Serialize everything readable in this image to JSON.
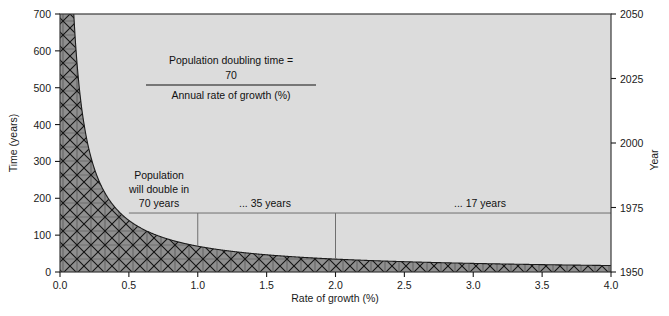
{
  "chart_data": {
    "type": "line",
    "title": "",
    "xlabel": "Rate of growth (%)",
    "ylabel": "Time (years)",
    "y2label": "Year",
    "xlim": [
      0.0,
      4.0
    ],
    "ylim": [
      0,
      700
    ],
    "y2lim": [
      1950,
      2050
    ],
    "grid": false,
    "legend": null,
    "function": "Time = 70 / Rate of growth",
    "xticks": [
      "0.0",
      "0.5",
      "1.0",
      "1.5",
      "2.0",
      "2.5",
      "3.0",
      "3.5",
      "4.0"
    ],
    "xtick_values": [
      0.0,
      0.5,
      1.0,
      1.5,
      2.0,
      2.5,
      3.0,
      3.5,
      4.0
    ],
    "yticks": [
      "0",
      "100",
      "200",
      "300",
      "400",
      "500",
      "600",
      "700"
    ],
    "ytick_values": [
      0,
      100,
      200,
      300,
      400,
      500,
      600,
      700
    ],
    "y2ticks": [
      "1950",
      "1975",
      "2000",
      "2025",
      "2050"
    ],
    "y2tick_values": [
      1950,
      1975,
      2000,
      2025,
      2050
    ],
    "series": [
      {
        "name": "Population doubling time",
        "x": [
          0.1,
          0.2,
          0.3,
          0.4,
          0.5,
          0.6,
          0.7,
          0.8,
          0.9,
          1.0,
          1.25,
          1.5,
          1.75,
          2.0,
          2.5,
          3.0,
          3.5,
          4.0
        ],
        "values": [
          700,
          350,
          233,
          175,
          140,
          117,
          100,
          88,
          78,
          70,
          56,
          47,
          40,
          35,
          28,
          23,
          20,
          17
        ]
      }
    ],
    "annotations": [
      {
        "name": "doubling-70",
        "text_lines": [
          "Population",
          "will double in",
          "70 years"
        ],
        "x": 0.72,
        "y": 300
      },
      {
        "name": "doubling-35",
        "text": "... 35 years",
        "x": 1.55,
        "y": 205
      },
      {
        "name": "doubling-17",
        "text": "... 17 years",
        "x": 3.2,
        "y": 205
      }
    ],
    "reference_lines": [
      {
        "name": "horizontal-1975",
        "orientation": "horizontal",
        "y": 160,
        "from_x": 0.5,
        "to_x": 4.0
      },
      {
        "name": "vline-1-percent",
        "orientation": "vertical",
        "x": 1.0,
        "from_y": 160,
        "to_y": 70
      },
      {
        "name": "vline-2-percent",
        "orientation": "vertical",
        "x": 2.0,
        "from_y": 160,
        "to_y": 35
      }
    ],
    "formula": {
      "numerator_label": "Population doubling time =",
      "numerator": "70",
      "denominator": "Annual rate of growth (%)"
    },
    "colors": {
      "plot_background": "#dcdcdc",
      "hatch_fill": "#8c8c8c",
      "hatch_stroke": "#1a1a1a",
      "axis": "#1a1a1a",
      "reference_line": "#6f6f6f",
      "text": "#111111",
      "page_background": "#ffffff"
    }
  }
}
